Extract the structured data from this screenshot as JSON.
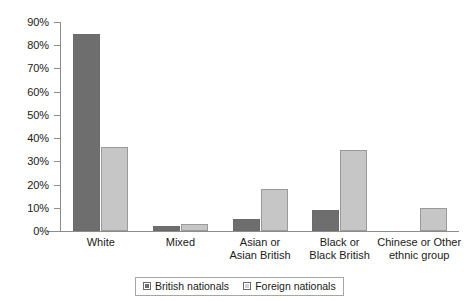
{
  "chart_data": {
    "type": "bar",
    "title": "",
    "subtitle": "",
    "xlabel": "",
    "ylabel": "",
    "ylim": [
      0,
      90
    ],
    "ytick_labels": [
      "90%",
      "80%",
      "70%",
      "60%",
      "50%",
      "40%",
      "30%",
      "20%",
      "10%",
      "0%"
    ],
    "ytick_values": [
      90,
      80,
      70,
      60,
      50,
      40,
      30,
      20,
      10,
      0
    ],
    "grid": false,
    "legend_position": "bottom",
    "categories": [
      "White",
      "Mixed",
      "Asian or\nAsian British",
      "Black or\nBlack British",
      "Chinese or Other\nethnic group"
    ],
    "category_lines": [
      [
        "White"
      ],
      [
        "Mixed"
      ],
      [
        "Asian or",
        "Asian British"
      ],
      [
        "Black or",
        "Black British"
      ],
      [
        "Chinese or Other",
        "ethnic group"
      ]
    ],
    "series": [
      {
        "name": "British nationals",
        "color": "#6e6e6e",
        "values": [
          85,
          2,
          5,
          9,
          0
        ]
      },
      {
        "name": "Foreign nationals",
        "color": "#c6c6c6",
        "values": [
          36,
          3,
          18,
          35,
          10
        ]
      }
    ]
  },
  "legend": {
    "entries": [
      {
        "label": "British nationals"
      },
      {
        "label": "Foreign nationals"
      }
    ]
  }
}
